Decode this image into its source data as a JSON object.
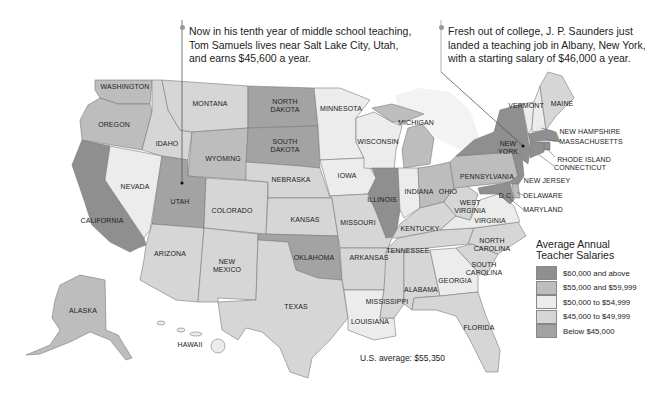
{
  "annotations": [
    {
      "id": "utah",
      "text": "Now in his tenth year of middle school teaching, Tom Samuels lives near Salt Lake City, Utah, and earns $45,600 a year."
    },
    {
      "id": "new_york",
      "text": "Fresh out of college, J. P. Saunders just landed a teaching job in Albany, New York, with a starting salary of $46,000 a year."
    }
  ],
  "legend": {
    "title": "Average Annual Teacher Salaries",
    "items": [
      {
        "label": "$60,000 and above",
        "color": "#8f8f8f"
      },
      {
        "label": "$55,000 and $59,999",
        "color": "#bdbdbd"
      },
      {
        "label": "$50,000 to $54,999",
        "color": "#ececec"
      },
      {
        "label": "$45,000 to $49,999",
        "color": "#d6d6d6"
      },
      {
        "label": "Below $45,000",
        "color": "#a3a3a3"
      }
    ]
  },
  "us_average": "U.S. average: $55,350",
  "states": {
    "washington": {
      "label": "WASHINGTON",
      "bracket": "$55,000 and $59,999"
    },
    "oregon": {
      "label": "OREGON",
      "bracket": "$55,000 and $59,999"
    },
    "california": {
      "label": "CALIFORNIA",
      "bracket": "$60,000 and above"
    },
    "nevada": {
      "label": "NEVADA",
      "bracket": "$50,000 to $54,999"
    },
    "idaho": {
      "label": "IDAHO",
      "bracket": "$45,000 to $49,999"
    },
    "montana": {
      "label": "MONTANA",
      "bracket": "$45,000 to $49,999"
    },
    "wyoming": {
      "label": "WYOMING",
      "bracket": "$55,000 and $59,999"
    },
    "utah": {
      "label": "UTAH",
      "bracket": "Below $45,000"
    },
    "colorado": {
      "label": "COLORADO",
      "bracket": "$45,000 to $49,999"
    },
    "arizona": {
      "label": "ARIZONA",
      "bracket": "$45,000 to $49,999"
    },
    "new_mexico": {
      "label": "NEW MEXICO",
      "bracket": "$45,000 to $49,999"
    },
    "north_dakota": {
      "label": "NORTH DAKOTA",
      "bracket": "Below $45,000"
    },
    "south_dakota": {
      "label": "SOUTH DAKOTA",
      "bracket": "Below $45,000"
    },
    "nebraska": {
      "label": "NEBRASKA",
      "bracket": "$45,000 to $49,999"
    },
    "kansas": {
      "label": "KANSAS",
      "bracket": "$45,000 to $49,999"
    },
    "oklahoma": {
      "label": "OKLAHOMA",
      "bracket": "Below $45,000"
    },
    "texas": {
      "label": "TEXAS",
      "bracket": "$45,000 to $49,999"
    },
    "minnesota": {
      "label": "MINNESOTA",
      "bracket": "$50,000 to $54,999"
    },
    "iowa": {
      "label": "IOWA",
      "bracket": "$50,000 to $54,999"
    },
    "missouri": {
      "label": "MISSOURI",
      "bracket": "$45,000 to $49,999"
    },
    "arkansas": {
      "label": "ARKANSAS",
      "bracket": "$45,000 to $49,999"
    },
    "louisiana": {
      "label": "LOUISIANA",
      "bracket": "$50,000 to $54,999"
    },
    "wisconsin": {
      "label": "WISCONSIN",
      "bracket": "$50,000 to $54,999"
    },
    "illinois": {
      "label": "ILLINOIS",
      "bracket": "$60,000 and above"
    },
    "michigan": {
      "label": "MICHIGAN",
      "bracket": "$55,000 and $59,999"
    },
    "indiana": {
      "label": "INDIANA",
      "bracket": "$50,000 to $54,999"
    },
    "ohio": {
      "label": "OHIO",
      "bracket": "$55,000 and $59,999"
    },
    "kentucky": {
      "label": "KENTUCKY",
      "bracket": "$45,000 to $49,999"
    },
    "tennessee": {
      "label": "TENNESSEE",
      "bracket": "$45,000 to $49,999"
    },
    "mississippi": {
      "label": "MISSISSIPPI",
      "bracket": "$45,000 to $49,999"
    },
    "alabama": {
      "label": "ALABAMA",
      "bracket": "$45,000 to $49,999"
    },
    "georgia": {
      "label": "GEORGIA",
      "bracket": "$50,000 to $54,999"
    },
    "florida": {
      "label": "FLORIDA",
      "bracket": "$45,000 to $49,999"
    },
    "south_carolina": {
      "label": "SOUTH CAROLINA",
      "bracket": "$45,000 to $49,999"
    },
    "north_carolina": {
      "label": "NORTH CAROLINA",
      "bracket": "$45,000 to $49,999"
    },
    "virginia": {
      "label": "VIRGINIA",
      "bracket": "$50,000 to $54,999"
    },
    "west_virginia": {
      "label": "WEST VIRGINIA",
      "bracket": "$45,000 to $49,999"
    },
    "pennsylvania": {
      "label": "PENNSYLVANIA",
      "bracket": "$55,000 and $59,999"
    },
    "new_york": {
      "label": "NEW YORK",
      "bracket": "$60,000 and above"
    },
    "vermont": {
      "label": "VERMONT",
      "bracket": "$50,000 to $54,999"
    },
    "new_hampshire": {
      "label": "NEW HAMPSHIRE",
      "bracket": "$50,000 to $54,999"
    },
    "maine": {
      "label": "MAINE",
      "bracket": "$45,000 to $49,999"
    },
    "massachusetts": {
      "label": "MASSACHUSETTS",
      "bracket": "$60,000 and above"
    },
    "rhode_island": {
      "label": "RHODE ISLAND",
      "bracket": "$60,000 and above"
    },
    "connecticut": {
      "label": "CONNECTICUT",
      "bracket": "$60,000 and above"
    },
    "new_jersey": {
      "label": "NEW JERSEY",
      "bracket": "$60,000 and above"
    },
    "delaware": {
      "label": "DELAWARE",
      "bracket": "$55,000 and $59,999"
    },
    "maryland": {
      "label": "MARYLAND",
      "bracket": "$60,000 and above"
    },
    "dc": {
      "label": "D.C.",
      "bracket": "$60,000 and above"
    },
    "alaska": {
      "label": "ALASKA",
      "bracket": "$55,000 and $59,999"
    },
    "hawaii": {
      "label": "HAWAII",
      "bracket": "$50,000 to $54,999"
    }
  }
}
